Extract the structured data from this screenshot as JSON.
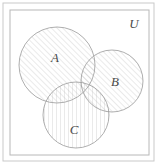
{
  "figure": {
    "kind": "venn-diagram",
    "title_visible": false,
    "background_color": "#ffffff",
    "outer_frame": {
      "name": "outer-frame",
      "x": 3,
      "y": 3,
      "width": 151,
      "height": 158,
      "stroke": "#c9c9c9",
      "stroke_width": 1
    },
    "inner_frame": {
      "name": "universe-box",
      "x": 10,
      "y": 10,
      "width": 139,
      "height": 145,
      "stroke": "#b8b8b8",
      "stroke_width": 1
    }
  },
  "universe": {
    "label": "U",
    "label_x": 134,
    "label_y": 28
  },
  "sets": [
    {
      "id": "A",
      "label": "A",
      "cx": 57,
      "cy": 65,
      "r": 38,
      "label_x": 55,
      "label_y": 62,
      "hatch": "diagonal-up",
      "stroke": "#9a9a9a"
    },
    {
      "id": "B",
      "label": "B",
      "cx": 112,
      "cy": 81,
      "r": 31,
      "label_x": 115,
      "label_y": 86,
      "hatch": "diagonal-up",
      "stroke": "#9a9a9a"
    },
    {
      "id": "C",
      "label": "C",
      "cx": 76,
      "cy": 115,
      "r": 33,
      "label_x": 74,
      "label_y": 134,
      "hatch": "vertical",
      "stroke": "#9a9a9a"
    }
  ],
  "style": {
    "hatch_color": "#b4b4b4",
    "hatch_width": 0.55,
    "hatch_spacing": 4,
    "circle_stroke": "#9a9a9a",
    "circle_stroke_width": 0.8,
    "label_color": "#4a4a4a",
    "frame_color": "#c4c4c4"
  }
}
